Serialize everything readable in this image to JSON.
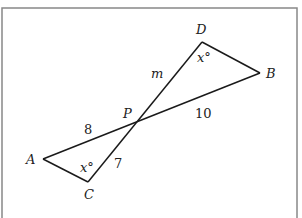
{
  "diagram": {
    "colors": {
      "stroke": "#1a1a1a",
      "frame": "#888888",
      "background": "#ffffff",
      "text": "#222222"
    },
    "frame": {
      "x": 2,
      "y": 8,
      "width": 295,
      "height": 214
    },
    "points": {
      "A": {
        "x": 43,
        "y": 159
      },
      "B": {
        "x": 260,
        "y": 73
      },
      "C": {
        "x": 88,
        "y": 182
      },
      "D": {
        "x": 202,
        "y": 42
      },
      "P": {
        "x": 136,
        "y": 122
      }
    },
    "segments": [
      {
        "from": "A",
        "to": "B"
      },
      {
        "from": "C",
        "to": "D"
      },
      {
        "from": "A",
        "to": "C"
      },
      {
        "from": "D",
        "to": "B"
      }
    ],
    "labels": {
      "A": "A",
      "B": "B",
      "C": "C",
      "D": "D",
      "P": "P",
      "m": "m",
      "len_PB": "10",
      "len_AP": "8",
      "len_PC": "7",
      "angle_D": "x°",
      "angle_C": "x°"
    }
  }
}
